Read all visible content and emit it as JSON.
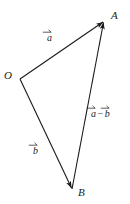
{
  "figure": {
    "type": "vector-triangle-diagram",
    "width": 130,
    "height": 204,
    "background_color": "#ffffff",
    "stroke_color": "#1a1a1a",
    "text_color": "#1a1a1a"
  },
  "points": {
    "origin": {
      "label": "O",
      "x": 20,
      "y": 79,
      "label_x": 4,
      "label_y": 71
    },
    "a_tip": {
      "label": "A",
      "x": 104,
      "y": 21,
      "label_x": 111,
      "label_y": 11
    },
    "b_tip": {
      "label": "B",
      "x": 72,
      "y": 189,
      "label_x": 78,
      "label_y": 188
    }
  },
  "vectors": [
    {
      "name": "vector-a",
      "from": "origin",
      "to": "a_tip",
      "label_letter": "a",
      "label_prefix": "",
      "label_suffix": "",
      "label_x": 46,
      "label_y": 30,
      "arrowhead": true
    },
    {
      "name": "vector-b",
      "from": "origin",
      "to": "b_tip",
      "label_letter": "b",
      "label_prefix": "",
      "label_suffix": "",
      "label_x": 32,
      "label_y": 143,
      "arrowhead": true
    },
    {
      "name": "vector-a-minus-b",
      "from": "b_tip",
      "to": "a_tip",
      "label_letter": "a",
      "label_second_letter": "b",
      "operator": "−",
      "label_x": 91,
      "label_y": 105,
      "arrowhead": true
    }
  ],
  "labels": {
    "point_o": "O",
    "point_a": "A",
    "point_b": "B",
    "vec_a": "a",
    "vec_b": "b",
    "minus": "−"
  }
}
